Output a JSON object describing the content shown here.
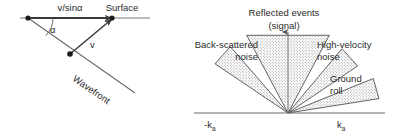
{
  "figure": {
    "background_color": "#ffffff",
    "line_color": "#3a3a3a",
    "text_color": "#2b2b2b",
    "stipple_color": "#7a7a7a"
  },
  "left_panel": {
    "name": "wavefront-apparent-velocity-diagram",
    "labels": {
      "apparent_velocity": "v/sinα",
      "surface": "Surface",
      "angle": "α",
      "velocity": "v",
      "wavefront": "Wavefront"
    },
    "geometry": {
      "surface_start_x": 28,
      "surface_start_y": 18,
      "surface_arrow_x": 113,
      "surface_arrow_y": 18,
      "surface_line_end_x": 148,
      "wavefront_vertex_x": 70,
      "wavefront_vertex_y": 54,
      "wavefront_end_x": 135,
      "wavefront_end_y": 93,
      "angle_degrees": 23
    }
  },
  "right_panel": {
    "name": "fk-noise-fan-diagram",
    "axis": {
      "negative_label_prefix": "-",
      "negative_label_base": "k",
      "negative_label_sub": "a",
      "positive_label_base": "k",
      "positive_label_sub": "a",
      "axis_y": 113,
      "axis_x_start": 14,
      "axis_x_end": 205,
      "apex_x": 108,
      "vertical_arrow_top_y": 32
    },
    "sectors": [
      {
        "id": "back-scattered-noise",
        "label_line1": "Back-scattered",
        "label_line2": "noise",
        "label_align": "right",
        "label_x": 78,
        "label_y1": 46,
        "label_y2": 58,
        "start_angle_deg": 131,
        "end_angle_deg": 146,
        "radius": 88,
        "leader": false
      },
      {
        "id": "reflected-events-signal",
        "label_line1": "Reflected events",
        "label_line2": "(signal)",
        "label_align": "center",
        "label_x": 104,
        "label_y1": 15,
        "label_y2": 28,
        "start_angle_deg": 62,
        "end_angle_deg": 118,
        "radius": 88,
        "leader": false
      },
      {
        "id": "high-velocity-noise",
        "label_line1": "High-velocity",
        "label_line2": "noise",
        "label_align": "left",
        "label_x": 137,
        "label_y1": 46,
        "label_y2": 58,
        "start_angle_deg": 34,
        "end_angle_deg": 50,
        "radius": 84,
        "leader": false
      },
      {
        "id": "ground-roll",
        "label_line1": "Ground",
        "label_line2": "roll",
        "label_align": "left",
        "label_x": 148,
        "label_y1": 80,
        "label_y2": 92,
        "start_angle_deg": 9,
        "end_angle_deg": 22,
        "radius": 92,
        "leader": false
      }
    ]
  }
}
